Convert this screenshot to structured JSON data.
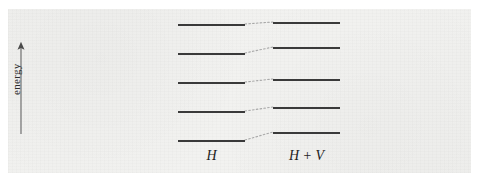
{
  "figure": {
    "kind": "energy-level-diagram",
    "background_color": "#f2f2f0",
    "line_color": "#3a3a3a",
    "connector_color": "#9a9a9a",
    "axis": {
      "label": "energy",
      "direction": "up",
      "icon": "up-arrow-icon",
      "x": 13,
      "y_top": 33,
      "y_bottom": 124
    },
    "columns": [
      {
        "id": "unperturbed",
        "label": "H",
        "label_x": 160,
        "label_y": 139,
        "x_start": 170,
        "x_end": 237,
        "levels": [
          {
            "index": 5,
            "y": 15
          },
          {
            "index": 4,
            "y": 44
          },
          {
            "index": 3,
            "y": 73
          },
          {
            "index": 2,
            "y": 102
          },
          {
            "index": 1,
            "y": 131
          }
        ]
      },
      {
        "id": "perturbed",
        "label": "H + V",
        "label_x": 265,
        "label_y": 139,
        "x_start": 265,
        "x_end": 332,
        "levels": [
          {
            "index": 5,
            "y": 13
          },
          {
            "index": 4,
            "y": 38
          },
          {
            "index": 3,
            "y": 70
          },
          {
            "index": 2,
            "y": 98
          },
          {
            "index": 1,
            "y": 123
          }
        ]
      }
    ],
    "connectors": [
      {
        "x1": 237,
        "y1": 15,
        "x2": 265,
        "y2": 13
      },
      {
        "x1": 237,
        "y1": 44,
        "x2": 265,
        "y2": 38
      },
      {
        "x1": 237,
        "y1": 73,
        "x2": 265,
        "y2": 70
      },
      {
        "x1": 237,
        "y1": 102,
        "x2": 265,
        "y2": 98
      },
      {
        "x1": 237,
        "y1": 131,
        "x2": 265,
        "y2": 123
      }
    ]
  }
}
